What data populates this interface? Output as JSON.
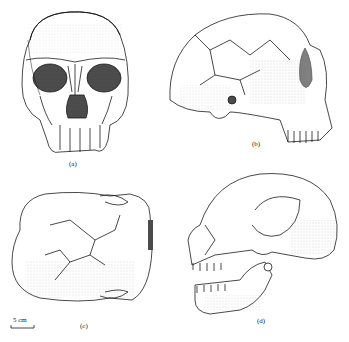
{
  "figure": {
    "panels": [
      {
        "id": "a",
        "label": "(a)",
        "view": "frontal view of skull"
      },
      {
        "id": "b",
        "label": "(b)",
        "view": "lateral view of cranium"
      },
      {
        "id": "c",
        "label": "(c)",
        "view": "superior view of cranium"
      },
      {
        "id": "d",
        "label": "(d)",
        "view": "lateral view of reconstructed skull with mandible"
      }
    ],
    "scale_bar": {
      "text": "5 cm"
    },
    "colors": {
      "ink": "#1a1a1a",
      "background": "#ffffff",
      "shade": "#555555"
    }
  }
}
